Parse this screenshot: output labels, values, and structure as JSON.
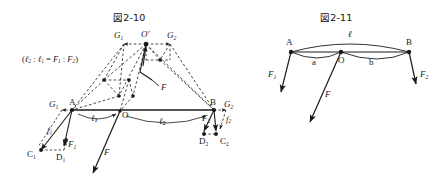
{
  "document": {
    "kind": "textbook-figure-pair",
    "background_color": "#ffffff",
    "ink_color": "#1a1a1a"
  },
  "figure_left": {
    "title": "図2-10",
    "formula": "(ℓ₂ : ℓ₁ = F₁ : F₂)",
    "formula_parts": {
      "open": "(",
      "l2": "ℓ",
      "l2_sub": "2",
      "ratio1": " : ",
      "l1": "ℓ",
      "l1_sub": "1",
      "equals": " = ",
      "F1": "F",
      "F1_sub": "1",
      "ratio2": " : ",
      "F2": "F",
      "F2_sub": "2",
      "close": ")"
    },
    "points": [
      {
        "name": "A",
        "label": "A",
        "x": 72,
        "y": 110
      },
      {
        "name": "B",
        "label": "B",
        "x": 214,
        "y": 110
      },
      {
        "name": "O",
        "label": "O",
        "x": 120,
        "y": 112
      },
      {
        "name": "O-prime",
        "label": "O′",
        "x": 146,
        "y": 40
      },
      {
        "name": "G1-top",
        "label": "G",
        "sub": "1",
        "x": 119,
        "y": 39
      },
      {
        "name": "G2-top",
        "label": "G",
        "sub": "2",
        "x": 172,
        "y": 39
      },
      {
        "name": "G1-low",
        "label": "G",
        "sub": "1",
        "x": 53,
        "y": 106
      },
      {
        "name": "G2-low",
        "label": "G",
        "sub": "2",
        "x": 229,
        "y": 106
      },
      {
        "name": "C1",
        "label": "C",
        "sub": "1",
        "x": 30,
        "y": 155
      },
      {
        "name": "D1",
        "label": "D",
        "sub": "1",
        "x": 60,
        "y": 158
      },
      {
        "name": "C2",
        "label": "C",
        "sub": "2",
        "x": 225,
        "y": 140
      },
      {
        "name": "D2",
        "label": "D",
        "sub": "2",
        "x": 203,
        "y": 140
      }
    ],
    "segment_labels": [
      {
        "name": "l1",
        "label": "ℓ",
        "sub": "1",
        "x": 95,
        "y": 118
      },
      {
        "name": "l2",
        "label": "ℓ",
        "sub": "2",
        "x": 163,
        "y": 118
      }
    ],
    "force_labels": [
      {
        "name": "F-center",
        "label": "F",
        "sub": "",
        "x": 108,
        "y": 155
      },
      {
        "name": "F-upper",
        "label": "F",
        "sub": "",
        "x": 151,
        "y": 83
      },
      {
        "name": "F1",
        "label": "F",
        "sub": "1",
        "x": 66,
        "y": 145
      },
      {
        "name": "F2",
        "label": "F",
        "sub": "2",
        "x": 205,
        "y": 119
      },
      {
        "name": "f1",
        "label": "f",
        "sub": "1",
        "x": 50,
        "y": 131
      },
      {
        "name": "f2",
        "label": "f",
        "sub": "2",
        "x": 229,
        "y": 120
      }
    ]
  },
  "figure_right": {
    "title": "図2-11",
    "points": [
      {
        "name": "A",
        "label": "A",
        "x": 291,
        "y": 48
      },
      {
        "name": "O",
        "label": "O",
        "x": 341,
        "y": 60
      },
      {
        "name": "B",
        "label": "B",
        "x": 409,
        "y": 48
      }
    ],
    "segment_labels": [
      {
        "name": "l-total",
        "label": "ℓ",
        "x": 350,
        "y": 36
      },
      {
        "name": "a",
        "label": "a",
        "x": 315,
        "y": 62
      },
      {
        "name": "b",
        "label": "b",
        "x": 372,
        "y": 62
      }
    ],
    "force_labels": [
      {
        "name": "F1",
        "label": "F",
        "sub": "1",
        "x": 274,
        "y": 76
      },
      {
        "name": "F2",
        "label": "F",
        "sub": "2",
        "x": 412,
        "y": 76
      },
      {
        "name": "F",
        "label": "F",
        "sub": "",
        "x": 321,
        "y": 98
      }
    ]
  }
}
